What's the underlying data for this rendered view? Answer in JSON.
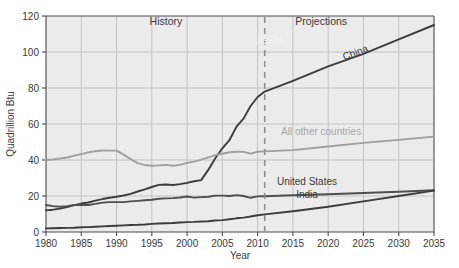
{
  "chart_data": {
    "type": "line",
    "title": "",
    "xlabel": "Year",
    "ylabel": "Quadrillion Btu",
    "xlim": [
      1980,
      2035
    ],
    "ylim": [
      0,
      120
    ],
    "grid": true,
    "legend_position": "inline-labels",
    "x_ticks": [
      1980,
      1985,
      1990,
      1995,
      2000,
      2005,
      2010,
      2015,
      2020,
      2025,
      2030,
      2035
    ],
    "x_tick_labels": [
      "1980",
      "1985",
      "1990",
      "1995",
      "2000",
      "2005",
      "2010",
      "2015",
      "2020",
      "2025",
      "2030",
      "2035"
    ],
    "y_ticks": [
      0,
      20,
      40,
      60,
      80,
      100,
      120
    ],
    "y_tick_labels": [
      "0",
      "20",
      "40",
      "60",
      "80",
      "100",
      "120"
    ],
    "annotations": [
      {
        "name": "history-label",
        "text": "History",
        "x": 1997,
        "y": 115
      },
      {
        "name": "projections-label",
        "text": "Projections",
        "x": 2019,
        "y": 115
      },
      {
        "name": "projection-divider",
        "text": "",
        "x": 2011,
        "y": 0,
        "style": "dashed-vertical"
      }
    ],
    "divider_year": 2011,
    "x": [
      1980,
      1981,
      1982,
      1983,
      1984,
      1985,
      1986,
      1987,
      1988,
      1989,
      1990,
      1991,
      1992,
      1993,
      1994,
      1995,
      1996,
      1997,
      1998,
      1999,
      2000,
      2001,
      2002,
      2003,
      2004,
      2005,
      2006,
      2007,
      2008,
      2009,
      2010,
      2011,
      2015,
      2020,
      2025,
      2030,
      2035
    ],
    "series": [
      {
        "name": "China",
        "label": "China",
        "color": "#3c3c3c",
        "values": [
          12.0,
          12.4,
          13.0,
          13.8,
          14.9,
          15.8,
          16.4,
          17.4,
          18.3,
          19.0,
          19.6,
          20.3,
          21.2,
          22.5,
          23.7,
          25.0,
          26.2,
          26.4,
          26.1,
          26.6,
          27.3,
          28.2,
          28.8,
          34.5,
          41.0,
          46.5,
          51.0,
          58.5,
          63.0,
          70.0,
          75.0,
          78.0,
          84.0,
          92.0,
          99.0,
          107.0,
          115.0
        ]
      },
      {
        "name": "All other countries",
        "label": "All other countries",
        "color": "#9f9f9f",
        "values": [
          40.0,
          40.3,
          40.8,
          41.4,
          42.4,
          43.3,
          44.2,
          44.9,
          45.3,
          45.2,
          45.2,
          43.0,
          40.5,
          38.3,
          37.2,
          36.8,
          37.0,
          37.3,
          36.8,
          37.3,
          38.4,
          39.1,
          40.2,
          41.5,
          42.7,
          43.5,
          44.3,
          44.6,
          44.5,
          43.5,
          44.6,
          44.8,
          45.5,
          47.5,
          49.5,
          51.2,
          53.0
        ]
      },
      {
        "name": "United States",
        "label": "United States",
        "color": "#4e4e4e",
        "values": [
          15.0,
          14.4,
          14.0,
          14.3,
          15.0,
          15.1,
          15.0,
          15.6,
          16.3,
          16.6,
          16.6,
          16.6,
          17.0,
          17.3,
          17.6,
          17.9,
          18.5,
          18.7,
          18.8,
          19.2,
          19.7,
          19.1,
          19.4,
          19.6,
          20.2,
          20.2,
          20.0,
          20.5,
          20.0,
          19.0,
          19.8,
          19.9,
          20.4,
          21.0,
          21.7,
          22.4,
          23.2
        ]
      },
      {
        "name": "India",
        "label": "India",
        "color": "#3c3c3c",
        "values": [
          2.0,
          2.1,
          2.2,
          2.3,
          2.4,
          2.6,
          2.7,
          2.9,
          3.1,
          3.3,
          3.5,
          3.7,
          3.9,
          4.0,
          4.2,
          4.5,
          4.7,
          4.9,
          5.0,
          5.3,
          5.5,
          5.6,
          5.8,
          6.0,
          6.4,
          6.6,
          7.1,
          7.6,
          8.0,
          8.6,
          9.3,
          9.8,
          11.5,
          14.0,
          17.0,
          20.0,
          23.0
        ]
      }
    ],
    "series_label_positions": [
      {
        "name": "china-label",
        "series": "China",
        "x": 2024,
        "y": 98,
        "rotated": true,
        "rotation": -21
      },
      {
        "name": "all-other-countries-label",
        "series": "All other countries",
        "x": 2019,
        "y": 54,
        "rotated": false,
        "rotation": 0
      },
      {
        "name": "united-states-label",
        "series": "United States",
        "x": 2017,
        "y": 26,
        "rotated": false,
        "rotation": 0
      },
      {
        "name": "india-label",
        "series": "India",
        "x": 2017,
        "y": 19,
        "rotated": false,
        "rotation": 0
      }
    ]
  }
}
